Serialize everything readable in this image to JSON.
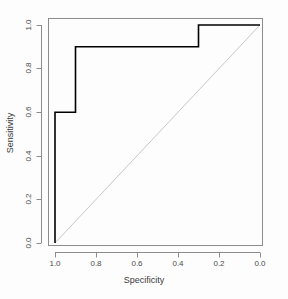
{
  "chart_data": {
    "type": "line",
    "title": "",
    "subtitle": "",
    "xlabel": "Specificity",
    "ylabel": "Sensitivity",
    "xlim": [
      1.0,
      0.0
    ],
    "ylim": [
      0.0,
      1.0
    ],
    "x_reversed": true,
    "grid": false,
    "legend": "none",
    "xticks": [
      "1.0",
      "0.8",
      "0.6",
      "0.4",
      "0.2",
      "0.0"
    ],
    "xtick_values": [
      1.0,
      0.8,
      0.6,
      0.4,
      0.2,
      0.0
    ],
    "yticks": [
      "0.0",
      "0.2",
      "0.4",
      "0.6",
      "0.8",
      "1.0"
    ],
    "ytick_values": [
      0.0,
      0.2,
      0.4,
      0.6,
      0.8,
      1.0
    ],
    "series": [
      {
        "name": "ROC curve",
        "color": "#000000",
        "width": 1.6,
        "style": "step",
        "x": [
          1.0,
          1.0,
          0.9,
          0.9,
          0.3,
          0.3,
          0.0
        ],
        "y": [
          0.0,
          0.6,
          0.6,
          0.9,
          0.9,
          1.0,
          1.0
        ]
      },
      {
        "name": "chance diagonal",
        "color": "#c8c8c8",
        "width": 1.0,
        "style": "solid",
        "x": [
          1.0,
          0.0
        ],
        "y": [
          0.0,
          1.0
        ]
      }
    ],
    "annotations": []
  },
  "axes": {
    "box_color": "#8c8c8c",
    "tick_color": "#8c8c8c",
    "x_title": "Specificity",
    "y_title": "Sensitivity"
  }
}
